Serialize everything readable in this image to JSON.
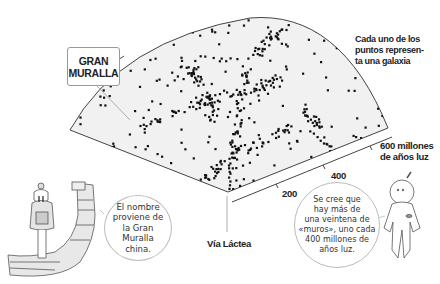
{
  "chart_data": {
    "type": "scatter",
    "title": "",
    "axis": {
      "label_unit": "millones de años luz",
      "ticks": [
        "200",
        "400",
        "600"
      ],
      "range": [
        0,
        600
      ]
    },
    "origin_label": "Vía Láctea",
    "annotations": [
      "GRAN MURALLA",
      "Cada uno de los puntos represen-ta una galaxia"
    ]
  },
  "callout": {
    "line1": "GRAN",
    "line2": "MURALLA"
  },
  "note": {
    "line1": "Cada uno de los",
    "line2": "puntos represen-",
    "line3": "ta una galaxia"
  },
  "axis": {
    "tick_200": "200",
    "tick_400": "400",
    "tick_600_line1": "600 millones",
    "tick_600_line2": "de años luz"
  },
  "origin": {
    "label": "Vía Láctea"
  },
  "bubble_left": {
    "line1": "El nombre",
    "line2": "proviene de",
    "line3": "la Gran",
    "line4": "Muralla",
    "line5": "china."
  },
  "bubble_right": {
    "line1": "Se cree que",
    "line2": "hay más de",
    "line3": "una veintena de",
    "line4": "«muros», uno cada",
    "line5": "400 millones de",
    "line6": "años luz."
  },
  "colors": {
    "fan_fill": "#f1f1f1",
    "dots": "#111111",
    "outline": "#444444",
    "bubble_border": "#bbbbbb"
  }
}
